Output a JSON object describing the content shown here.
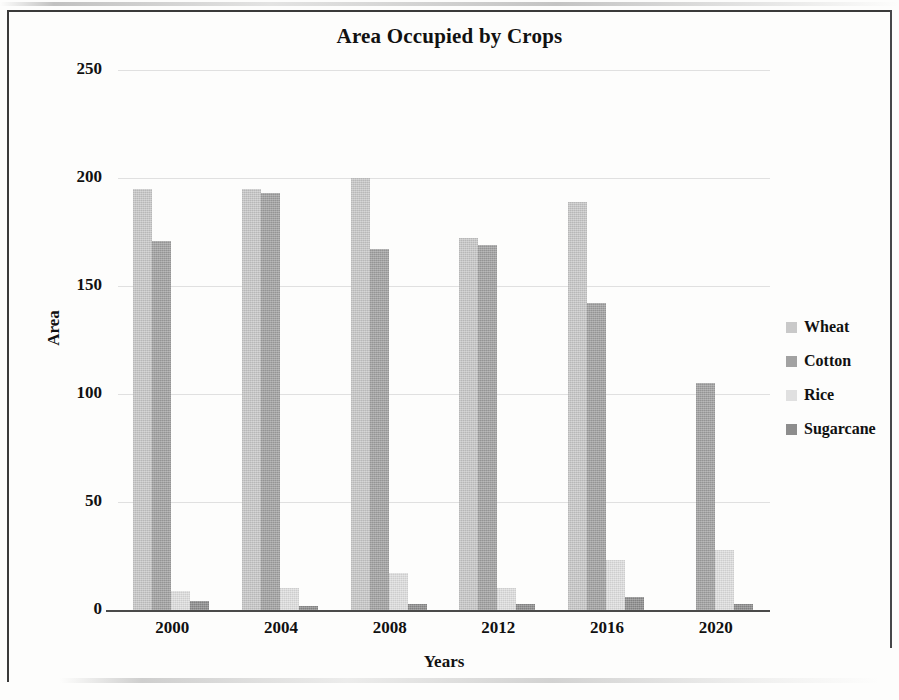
{
  "chart_data": {
    "type": "bar",
    "title": "Area Occupied by Crops",
    "xlabel": "Years",
    "ylabel": "Area",
    "categories": [
      "2000",
      "2004",
      "2008",
      "2012",
      "2016",
      "2020"
    ],
    "ylim": [
      0,
      250
    ],
    "yticks": [
      0,
      50,
      100,
      150,
      200,
      250
    ],
    "ytick_labels": [
      "0",
      "50",
      "100",
      "150",
      "200",
      "250"
    ],
    "grid": true,
    "legend_position": "right",
    "series": [
      {
        "name": "Wheat",
        "color": "#c9c9c9",
        "values": [
          195,
          195,
          200,
          172,
          189,
          0
        ]
      },
      {
        "name": "Cotton",
        "color": "#a2a2a2",
        "values": [
          171,
          193,
          167,
          169,
          142,
          105
        ]
      },
      {
        "name": "Rice",
        "color": "#e0e0e0",
        "values": [
          9,
          10,
          17,
          10,
          23,
          28
        ]
      },
      {
        "name": "Sugarcane",
        "color": "#8d8d8d",
        "values": [
          4,
          2,
          3,
          3,
          6,
          3
        ]
      }
    ]
  },
  "legend": {
    "items": [
      {
        "label": "Wheat"
      },
      {
        "label": "Cotton"
      },
      {
        "label": "Rice"
      },
      {
        "label": "Sugarcane"
      }
    ]
  }
}
